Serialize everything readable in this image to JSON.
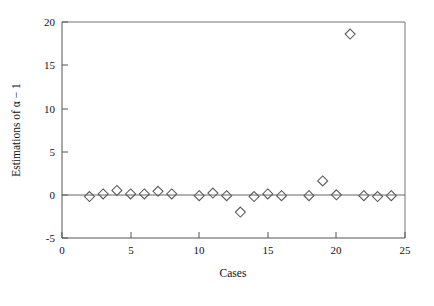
{
  "chart_data": {
    "type": "scatter",
    "title": "",
    "xlabel": "Cases",
    "ylabel": "Estimations of α − 1",
    "xlim": [
      0,
      25
    ],
    "ylim": [
      -5,
      20
    ],
    "xticks": [
      0,
      5,
      10,
      15,
      20,
      25
    ],
    "xtick_labels": [
      "0",
      "5",
      "10",
      "15",
      "20",
      "25"
    ],
    "yticks": [
      -5,
      0,
      5,
      10,
      15,
      20
    ],
    "ytick_labels": [
      "-5",
      "0",
      "5",
      "10",
      "15",
      "20"
    ],
    "grid": false,
    "legend": null,
    "marker": "diamond-open",
    "reference_line": {
      "y": 0,
      "style": "solid"
    },
    "x": [
      2,
      3,
      4,
      5,
      6,
      7,
      8,
      10,
      11,
      12,
      13,
      14,
      15,
      16,
      18,
      19,
      20,
      21,
      22,
      23,
      24
    ],
    "y": [
      -0.2,
      0.1,
      0.5,
      0.1,
      0.1,
      0.4,
      0.1,
      -0.1,
      0.2,
      -0.1,
      -2.0,
      -0.2,
      0.1,
      -0.1,
      -0.1,
      1.6,
      0.0,
      18.6,
      -0.1,
      -0.2,
      -0.1
    ],
    "series": [
      {
        "name": "Estimations",
        "points": [
          {
            "case": 2,
            "value": -0.2
          },
          {
            "case": 3,
            "value": 0.1
          },
          {
            "case": 4,
            "value": 0.5
          },
          {
            "case": 5,
            "value": 0.1
          },
          {
            "case": 6,
            "value": 0.1
          },
          {
            "case": 7,
            "value": 0.4
          },
          {
            "case": 8,
            "value": 0.1
          },
          {
            "case": 10,
            "value": -0.1
          },
          {
            "case": 11,
            "value": 0.2
          },
          {
            "case": 12,
            "value": -0.1
          },
          {
            "case": 13,
            "value": -2.0
          },
          {
            "case": 14,
            "value": -0.2
          },
          {
            "case": 15,
            "value": 0.1
          },
          {
            "case": 16,
            "value": -0.1
          },
          {
            "case": 18,
            "value": -0.1
          },
          {
            "case": 19,
            "value": 1.6
          },
          {
            "case": 20,
            "value": 0.0
          },
          {
            "case": 21,
            "value": 18.6
          },
          {
            "case": 22,
            "value": -0.1
          },
          {
            "case": 23,
            "value": -0.2
          },
          {
            "case": 24,
            "value": -0.1
          }
        ]
      }
    ]
  },
  "colors": {
    "marker_stroke": "#5a5a5a",
    "axis": "#555555",
    "frame": "#777777",
    "text": "#111111",
    "background": "#ffffff"
  }
}
